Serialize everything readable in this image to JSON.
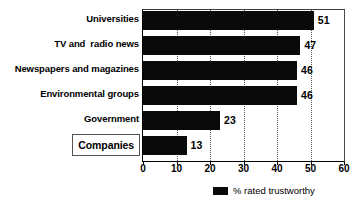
{
  "chart_data": {
    "type": "bar",
    "orientation": "horizontal",
    "title": "",
    "subtitle": "",
    "xlabel": "",
    "ylabel": "",
    "categories": [
      "Universities",
      "TV and  radio news",
      "Newspapers and magazines",
      "Environmental groups",
      "Government",
      "Companies"
    ],
    "values": [
      51,
      47,
      46,
      46,
      23,
      13
    ],
    "value_labels": [
      "51",
      "47",
      "46",
      "46",
      "23",
      "13"
    ],
    "series": [
      {
        "name": "% rated trustworthy",
        "values": [
          51,
          47,
          46,
          46,
          23,
          13
        ],
        "color": "#0a0a0a"
      }
    ],
    "xlim": [
      0,
      60
    ],
    "xticks": [
      0,
      10,
      20,
      30,
      40,
      50,
      60
    ],
    "xtick_labels": [
      "0",
      "10",
      "20",
      "30",
      "40",
      "50",
      "60"
    ],
    "grid": "vertical-dotted",
    "legend": {
      "position": "bottom-center",
      "entries": [
        {
          "label": "% rated trustworthy",
          "color": "#0a0a0a"
        }
      ]
    },
    "highlight": {
      "category": "Companies",
      "style": "boxed-label"
    },
    "colors": {
      "bar": "#0a0a0a",
      "grid": "#555555",
      "axis": "#000000",
      "background": "#ffffff",
      "text": "#000000"
    }
  }
}
